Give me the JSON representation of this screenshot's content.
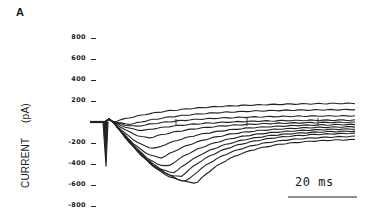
{
  "panel_label": "A",
  "chart_data": {
    "type": "line",
    "title": "",
    "xlabel": "",
    "ylabel": "CURRENT (pA)",
    "yticks": [
      800,
      600,
      400,
      200,
      -200,
      -400,
      -600,
      -800
    ],
    "ytick_labels": [
      "800",
      "600",
      "400",
      "200",
      "-200",
      "-400",
      "-600",
      "-800"
    ],
    "ylim": [
      -800,
      800
    ],
    "grid": false,
    "legend": null,
    "scale_bar": {
      "label": "20 ms",
      "duration_ms": 20
    },
    "series": [
      {
        "name": "trace 1",
        "peak_pA": 0,
        "peak_time_ms": 0,
        "late_pA": 180
      },
      {
        "name": "trace 2",
        "peak_pA": -20,
        "peak_time_ms": 6,
        "late_pA": 120
      },
      {
        "name": "trace 3",
        "peak_pA": -40,
        "peak_time_ms": 8,
        "late_pA": 60
      },
      {
        "name": "trace 4",
        "peak_pA": -80,
        "peak_time_ms": 10,
        "late_pA": 20
      },
      {
        "name": "trace 5",
        "peak_pA": -150,
        "peak_time_ms": 12,
        "late_pA": 0
      },
      {
        "name": "trace 6",
        "peak_pA": -250,
        "peak_time_ms": 14,
        "late_pA": -20
      },
      {
        "name": "trace 7",
        "peak_pA": -340,
        "peak_time_ms": 16,
        "late_pA": -40
      },
      {
        "name": "trace 8",
        "peak_pA": -420,
        "peak_time_ms": 18,
        "late_pA": -60
      },
      {
        "name": "trace 9",
        "peak_pA": -480,
        "peak_time_ms": 20,
        "late_pA": -80
      },
      {
        "name": "trace 10",
        "peak_pA": -520,
        "peak_time_ms": 22,
        "late_pA": -100
      },
      {
        "name": "trace 11",
        "peak_pA": -560,
        "peak_time_ms": 24,
        "late_pA": -130
      },
      {
        "name": "trace 12",
        "peak_pA": -580,
        "peak_time_ms": 27,
        "late_pA": -160
      }
    ],
    "capacitive_transient_min_pA": -420
  },
  "axis": {
    "ylabel": "CURRENT",
    "yunit": "(pA)"
  },
  "scale_bar_label": "20 ms"
}
